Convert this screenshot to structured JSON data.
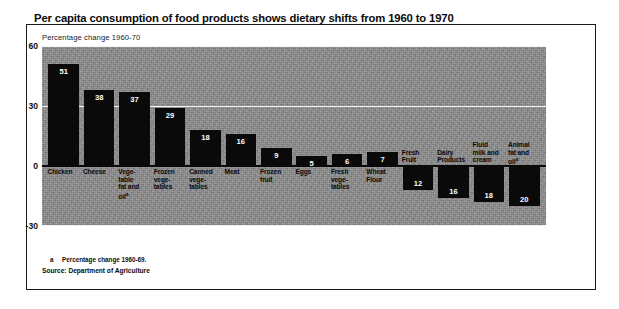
{
  "figure": {
    "title": "Per capita consumption of food products shows dietary shifts from 1960 to 1970",
    "subtitle": "Percentage change 1960-70",
    "footnote_marker": "a",
    "footnote": "Percentage change 1960-69.",
    "source": "Source: Department of Agriculture",
    "panel_color": "#8d8d8d",
    "bar_color": "#0a0a0a",
    "gridline_color": "#f2f2f2",
    "zeroline_color": "#0a0a0a"
  },
  "chart_data": {
    "type": "bar",
    "title": "Per capita consumption of food products shows dietary shifts from 1960 to 1970",
    "subtitle": "Percentage change 1960-70",
    "xlabel": "",
    "ylabel": "Percentage change 1960-70",
    "ylim": [
      -30,
      60
    ],
    "yticks": [
      60,
      30,
      0,
      -30
    ],
    "ytick_labels": [
      "60",
      "30",
      "0",
      "-30"
    ],
    "grid": true,
    "legend": false,
    "orientation": "vertical",
    "categories": [
      "Chicken",
      "Cheese",
      "Vege-table fat and oil",
      "Frozen vege-tables",
      "Canned vege-tables",
      "Meat",
      "Frozen fruit",
      "Eggs",
      "Fresh vege-tables",
      "Wheat Flour",
      "Fresh Fruit",
      "Dairy Products",
      "Fluid milk and cream",
      "Animal fat and oil"
    ],
    "category_lines": [
      [
        "Chicken"
      ],
      [
        "Cheese"
      ],
      [
        "Vege-",
        "table",
        "fat and",
        "oil"
      ],
      [
        "Frozen",
        "vege-",
        "tables"
      ],
      [
        "Canned",
        "vege-",
        "tables"
      ],
      [
        "Meat"
      ],
      [
        "Frozen",
        "fruit"
      ],
      [
        "Eggs"
      ],
      [
        "Fresh",
        "vege-",
        "tables"
      ],
      [
        "Wheat",
        "Flour"
      ],
      [
        "Fresh",
        "Fruit"
      ],
      [
        "Dairy",
        "Products"
      ],
      [
        "Fluid",
        "milk and",
        "cream"
      ],
      [
        "Animal",
        "fat and",
        "oil"
      ]
    ],
    "values": [
      51,
      38,
      37,
      29,
      18,
      16,
      9,
      5,
      6,
      7,
      -12,
      -16,
      -18,
      -20
    ],
    "data_labels": [
      "51",
      "38",
      "37",
      "29",
      "18",
      "16",
      "9",
      "5",
      "6",
      "7",
      "12",
      "16",
      "18",
      "20"
    ],
    "footnote_categories": [
      "Vege-table fat and oil",
      "Animal fat and oil"
    ]
  }
}
